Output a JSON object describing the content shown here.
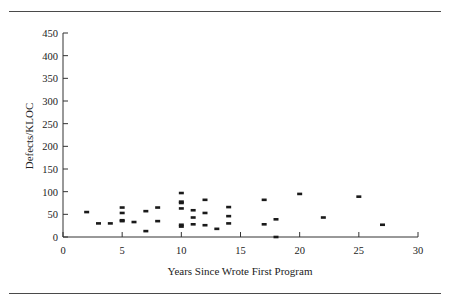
{
  "chart_data": {
    "type": "scatter",
    "title": "",
    "xlabel": "Years Since Wrote First Program",
    "ylabel": "Defects/KLOC",
    "xlim": [
      0,
      30
    ],
    "ylim": [
      0,
      450
    ],
    "xticks": [
      0,
      5,
      10,
      15,
      20,
      25,
      30
    ],
    "yticks": [
      0,
      50,
      100,
      150,
      200,
      250,
      300,
      350,
      400,
      450
    ],
    "grid": false,
    "legend": null,
    "marker": "small filled dash/rectangle",
    "marker_color": "#1a1a1a",
    "points": [
      {
        "x": 2,
        "y": 55
      },
      {
        "x": 3,
        "y": 30
      },
      {
        "x": 4,
        "y": 30
      },
      {
        "x": 5,
        "y": 65
      },
      {
        "x": 5,
        "y": 53
      },
      {
        "x": 5,
        "y": 37
      },
      {
        "x": 5,
        "y": 35
      },
      {
        "x": 6,
        "y": 33
      },
      {
        "x": 7,
        "y": 57
      },
      {
        "x": 7,
        "y": 13
      },
      {
        "x": 8,
        "y": 65
      },
      {
        "x": 8,
        "y": 35
      },
      {
        "x": 10,
        "y": 97
      },
      {
        "x": 10,
        "y": 78
      },
      {
        "x": 10,
        "y": 75
      },
      {
        "x": 10,
        "y": 63
      },
      {
        "x": 10,
        "y": 27
      },
      {
        "x": 10,
        "y": 23
      },
      {
        "x": 11,
        "y": 59
      },
      {
        "x": 11,
        "y": 43
      },
      {
        "x": 11,
        "y": 28
      },
      {
        "x": 12,
        "y": 82
      },
      {
        "x": 12,
        "y": 53
      },
      {
        "x": 12,
        "y": 26
      },
      {
        "x": 13,
        "y": 18
      },
      {
        "x": 14,
        "y": 66
      },
      {
        "x": 14,
        "y": 46
      },
      {
        "x": 14,
        "y": 30
      },
      {
        "x": 17,
        "y": 82
      },
      {
        "x": 17,
        "y": 28
      },
      {
        "x": 18,
        "y": 39
      },
      {
        "x": 18,
        "y": 0
      },
      {
        "x": 20,
        "y": 95
      },
      {
        "x": 22,
        "y": 43
      },
      {
        "x": 25,
        "y": 89
      },
      {
        "x": 27,
        "y": 27
      }
    ]
  },
  "labels": {
    "xlabel": "Years Since Wrote First Program",
    "ylabel": "Defects/KLOC"
  }
}
